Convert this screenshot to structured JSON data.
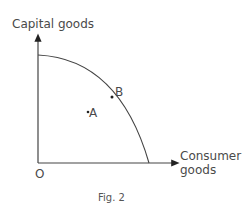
{
  "diagram": {
    "y_axis_label": "Capital goods",
    "x_axis_label_line1": "Consumer",
    "x_axis_label_line2": "goods",
    "origin_label": "O",
    "point_a_label": "A",
    "point_b_label": "B",
    "caption": "Fig. 2",
    "curve": "production possibility frontier",
    "colors": {
      "line": "#444444",
      "text": "#4a4a4a"
    }
  }
}
